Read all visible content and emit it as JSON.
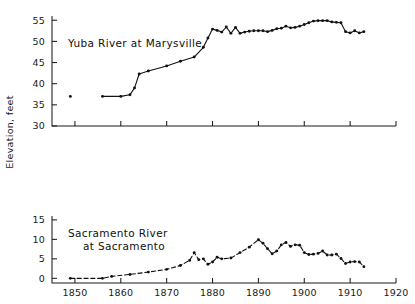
{
  "figure": {
    "shared_axis_title": "Elevation, feet",
    "background_color": "#ffffff",
    "ink_color": "#111111"
  },
  "chart_data": [
    {
      "type": "line",
      "title": "Yuba River at Marysville",
      "xlabel": "",
      "ylabel": "Elevation, feet",
      "xlim": [
        1845,
        1920
      ],
      "ylim": [
        30,
        56
      ],
      "xticks": [
        1850,
        1860,
        1870,
        1880,
        1890,
        1900,
        1910,
        1920
      ],
      "xticklabels": [
        "",
        "",
        "",
        "",
        "",
        "",
        "",
        ""
      ],
      "yticks": [
        30,
        35,
        40,
        45,
        50,
        55
      ],
      "yticklabels": [
        "30",
        "35",
        "40",
        "45",
        "50",
        "55"
      ],
      "grid": false,
      "legend": false,
      "linestyle": "solid",
      "marker": "filled-circle",
      "x": [
        1849,
        1856,
        1860,
        1862,
        1863,
        1864,
        1866,
        1870,
        1873,
        1876,
        1878,
        1879,
        1880,
        1881,
        1882,
        1883,
        1884,
        1885,
        1886,
        1887,
        1888,
        1889,
        1890,
        1891,
        1892,
        1893,
        1894,
        1895,
        1896,
        1897,
        1898,
        1899,
        1900,
        1901,
        1902,
        1903,
        1904,
        1905,
        1906,
        1907,
        1908,
        1909,
        1910,
        1911,
        1912,
        1913
      ],
      "y": [
        37.0,
        37.0,
        37.0,
        37.4,
        39.0,
        42.3,
        43.0,
        44.2,
        45.3,
        46.3,
        48.6,
        50.8,
        52.9,
        52.6,
        52.2,
        53.4,
        51.9,
        53.3,
        51.9,
        52.2,
        52.4,
        52.5,
        52.5,
        52.5,
        52.3,
        52.6,
        53.0,
        53.1,
        53.6,
        53.2,
        53.3,
        53.6,
        54.0,
        54.4,
        54.8,
        54.9,
        54.9,
        54.9,
        54.6,
        54.5,
        54.4,
        52.3,
        52.0,
        52.5,
        52.0,
        52.3
      ],
      "segments": [
        {
          "from_index": 0,
          "to_index": 0,
          "style": "isolated-point"
        },
        {
          "from_index": 1,
          "to_index": 45,
          "style": "solid"
        }
      ],
      "flat_start_note": "37 ft level held from 1849 through about 1862"
    },
    {
      "type": "line",
      "title_line1": "Sacramento River",
      "title_line2": "at Sacramento",
      "title": "Sacramento River at Sacramento",
      "xlabel": "",
      "ylabel": "Elevation, feet",
      "xlim": [
        1845,
        1920
      ],
      "ylim": [
        -1.2,
        16
      ],
      "xticks": [
        1850,
        1860,
        1870,
        1880,
        1890,
        1900,
        1910,
        1920
      ],
      "xticklabels": [
        "1850",
        "1860",
        "1870",
        "1880",
        "1890",
        "1900",
        "1910",
        "1920"
      ],
      "yticks": [
        0,
        5,
        10,
        15
      ],
      "yticklabels": [
        "0",
        "5",
        "10",
        "15"
      ],
      "grid": false,
      "legend": false,
      "linestyle": "dashed",
      "marker": "filled-circle",
      "x": [
        1849,
        1856,
        1858,
        1862,
        1866,
        1870,
        1873,
        1875,
        1876,
        1877,
        1878,
        1879,
        1880,
        1881,
        1882,
        1884,
        1886,
        1888,
        1890,
        1891,
        1892,
        1893,
        1894,
        1895,
        1896,
        1897,
        1898,
        1899,
        1900,
        1901,
        1902,
        1903,
        1904,
        1905,
        1906,
        1907,
        1908,
        1909,
        1910,
        1911,
        1912,
        1913
      ],
      "y": [
        0.0,
        0.0,
        0.5,
        1.0,
        1.6,
        2.3,
        3.3,
        4.6,
        6.6,
        4.8,
        5.0,
        3.6,
        4.2,
        5.4,
        5.0,
        5.2,
        6.6,
        8.0,
        9.9,
        9.0,
        7.6,
        6.3,
        7.0,
        8.6,
        9.2,
        8.2,
        8.6,
        8.5,
        6.6,
        6.1,
        6.2,
        6.4,
        7.0,
        6.0,
        6.0,
        6.2,
        5.1,
        3.8,
        4.2,
        4.3,
        4.2,
        3.0
      ]
    }
  ]
}
